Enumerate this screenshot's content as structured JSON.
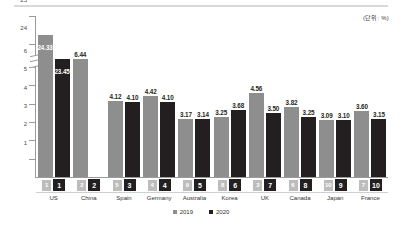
{
  "unit_note": "(단위: %)",
  "legend": {
    "items": [
      {
        "label": "2019",
        "color": "#8e8e8e"
      },
      {
        "label": "2020",
        "color": "#231f20"
      }
    ]
  },
  "axis": {
    "upper_ticks": [
      "25",
      "24"
    ],
    "lower_ticks": [
      "6",
      "5",
      "4",
      "3",
      "2",
      "1"
    ],
    "broken": true
  },
  "chart_data": {
    "type": "bar",
    "title": "",
    "subtitle": "",
    "xlabel": "",
    "ylabel": "",
    "unit": "%",
    "grid": false,
    "legend_position": "bottom",
    "broken_axis": true,
    "axis_break_between": [
      6.5,
      23.5
    ],
    "ylim": [
      0,
      25
    ],
    "ytick_labels": [
      "1",
      "2",
      "3",
      "4",
      "5",
      "6",
      "24",
      "25"
    ],
    "categories": [
      "US",
      "China",
      "Spain",
      "Germany",
      "Australia",
      "Korea",
      "UK",
      "Canada",
      "Japan",
      "France"
    ],
    "series": [
      {
        "name": "2019",
        "color": "#8e8e8e",
        "values": [
          24.33,
          6.44,
          4.12,
          4.42,
          3.17,
          3.25,
          4.56,
          3.82,
          3.09,
          3.6
        ],
        "labels": [
          "24.33",
          "6.44",
          "4.12",
          "4.42",
          "3.17",
          "3.25",
          "4.56",
          "3.82",
          "3.09",
          "3.60"
        ]
      },
      {
        "name": "2020",
        "color": "#231f20",
        "values": [
          23.45,
          7.06,
          4.1,
          4.1,
          3.14,
          3.68,
          3.5,
          3.25,
          3.1,
          3.15
        ],
        "labels": [
          "23.45",
          "7.06",
          "4.10",
          "4.10",
          "3.14",
          "3.68",
          "3.50",
          "3.25",
          "3.10",
          "3.15"
        ]
      }
    ],
    "ranks": {
      "2019": [
        "1",
        "2",
        "5",
        "4",
        "9",
        "8",
        "3",
        "6",
        "10",
        "7"
      ],
      "2020": [
        "1",
        "2",
        "3",
        "4",
        "5",
        "6",
        "7",
        "8",
        "9",
        "10"
      ]
    }
  }
}
